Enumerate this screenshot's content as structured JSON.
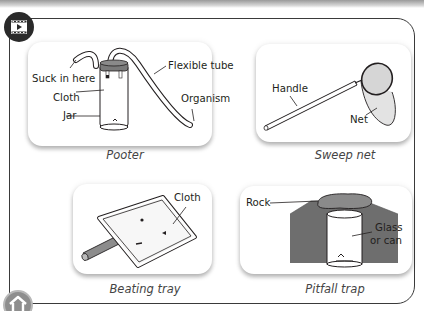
{
  "header": {
    "video_icon": "video-play-icon",
    "home_icon": "home-icon"
  },
  "panels": [
    {
      "id": "pooter",
      "caption": "Pooter",
      "labels": {
        "suck": "Suck in here",
        "cloth": "Cloth",
        "jar": "Jar",
        "tube": "Flexible tube",
        "organism": "Organism"
      }
    },
    {
      "id": "sweep-net",
      "caption": "Sweep net",
      "labels": {
        "handle": "Handle",
        "net": "Net"
      }
    },
    {
      "id": "beating-tray",
      "caption": "Beating tray",
      "labels": {
        "cloth": "Cloth"
      }
    },
    {
      "id": "pitfall-trap",
      "caption": "Pitfall trap",
      "labels": {
        "rock": "Rock",
        "glass_line1": "Glass",
        "glass_line2": "or can"
      }
    }
  ],
  "colors": {
    "frame": "#3a3a3a",
    "soil": "#6e6e6e",
    "rock": "#8a8a8a",
    "lid": "#7a7a7a",
    "net": "#d9d9d9"
  }
}
